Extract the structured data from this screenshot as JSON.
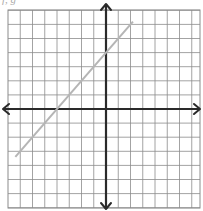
{
  "caption": "f, g",
  "chart_data": {
    "type": "line",
    "title": "",
    "xlabel": "",
    "ylabel": "",
    "grid": true,
    "xlim": [
      -8,
      8
    ],
    "ylim": [
      -7,
      7
    ],
    "axis_arrows": true,
    "series": [
      {
        "name": "line",
        "equation": "y = x + 4",
        "slope": 1,
        "y_intercept": 4,
        "x_intercept": -4,
        "x": [
          -7.4,
          2.2
        ],
        "y": [
          -3.4,
          6.2
        ],
        "color": "#b5b5b5"
      }
    ]
  },
  "colors": {
    "grid": "#8c8c8c",
    "axis": "#2a2a2a",
    "line": "#b5b5b5"
  }
}
